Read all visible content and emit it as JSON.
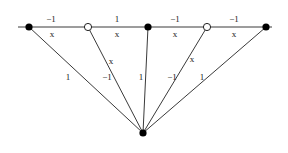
{
  "diagram": {
    "type": "graph",
    "top_line": {
      "x1": 18,
      "x2": 272,
      "y": 27
    },
    "top_nodes": [
      {
        "id": "n1",
        "x": 29,
        "y": 27,
        "style": "filled"
      },
      {
        "id": "n2",
        "x": 88,
        "y": 27,
        "style": "open"
      },
      {
        "id": "n3",
        "x": 148,
        "y": 27,
        "style": "filled"
      },
      {
        "id": "n4",
        "x": 207,
        "y": 27,
        "style": "open"
      },
      {
        "id": "n5",
        "x": 266,
        "y": 27,
        "style": "filled"
      }
    ],
    "bottom_node": {
      "id": "b",
      "x": 143,
      "y": 133,
      "style": "filled"
    },
    "horizontal_edges": [
      {
        "from": "n1",
        "to": "n2",
        "above": "−1",
        "below": "x"
      },
      {
        "from": "n2",
        "to": "n3",
        "above": "1",
        "below": "x"
      },
      {
        "from": "n3",
        "to": "n4",
        "above": "−1",
        "below": "x"
      },
      {
        "from": "n4",
        "to": "n5",
        "above": "−1",
        "below": "x"
      }
    ],
    "spoke_edges": [
      {
        "from": "n1",
        "to": "b",
        "labels": [
          "1"
        ]
      },
      {
        "from": "n2",
        "to": "b",
        "labels": [
          "x",
          "−1"
        ]
      },
      {
        "from": "n3",
        "to": "b",
        "labels": [
          "1"
        ]
      },
      {
        "from": "n4",
        "to": "b",
        "labels": [
          "x",
          "−1"
        ]
      },
      {
        "from": "n5",
        "to": "b",
        "labels": [
          "1"
        ]
      }
    ]
  },
  "labels": {
    "h1_top": "−1",
    "h1_bot": "x",
    "h2_top": "1",
    "h2_bot": "x",
    "h3_top": "−1",
    "h3_bot": "x",
    "h4_top": "−1",
    "h4_bot": "x",
    "s1": "1",
    "s2_x": "x",
    "s2_w": "−1",
    "s3": "1",
    "s4_x": "x",
    "s4_w": "−1",
    "s5": "1"
  }
}
